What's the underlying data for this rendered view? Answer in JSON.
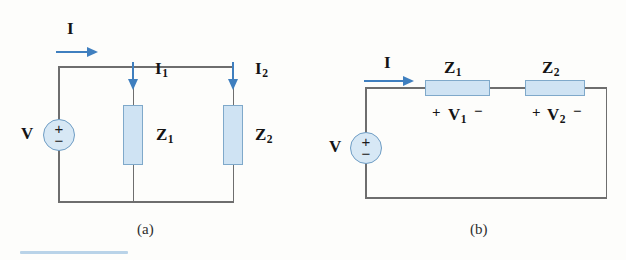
{
  "figure": {
    "background_color": "#fdfdfb",
    "wire_color": "#6e6e6e",
    "component_fill": "#cfe3f3",
    "component_stroke": "#7fa9ca",
    "arrow_color": "#3f7fbf",
    "source_fill": "#d7e8f5",
    "rule_color": "#b9d3e8"
  },
  "circuit_a": {
    "caption": "(a)",
    "source": {
      "label": "V",
      "plus": "+",
      "minus": "−"
    },
    "total_current": {
      "label": "I",
      "subscript": "",
      "arrow": "arrow-right"
    },
    "branches": [
      {
        "impedance_label": "Z",
        "impedance_subscript": "1",
        "current_label": "I",
        "current_subscript": "1",
        "arrow": "arrow-down"
      },
      {
        "impedance_label": "Z",
        "impedance_subscript": "2",
        "current_label": "I",
        "current_subscript": "2",
        "arrow": "arrow-down"
      }
    ]
  },
  "circuit_b": {
    "caption": "(b)",
    "source": {
      "label": "V",
      "plus": "+",
      "minus": "−"
    },
    "total_current": {
      "label": "I",
      "subscript": "",
      "arrow": "arrow-right"
    },
    "elements": [
      {
        "impedance_label": "Z",
        "impedance_subscript": "1",
        "polarity_plus": "+",
        "voltage_label": "V",
        "voltage_subscript": "1",
        "polarity_minus": "−"
      },
      {
        "impedance_label": "Z",
        "impedance_subscript": "2",
        "polarity_plus": "+",
        "voltage_label": "V",
        "voltage_subscript": "2",
        "polarity_minus": "−"
      }
    ]
  }
}
